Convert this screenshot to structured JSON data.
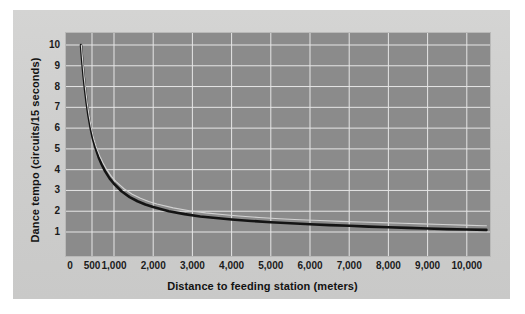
{
  "chart_data": {
    "type": "line",
    "title": "",
    "xlabel": "Distance to feeding station (meters)",
    "ylabel": "Dance tempo (circuits/15 seconds)",
    "xlim": [
      0,
      10500
    ],
    "ylim": [
      0,
      10.6
    ],
    "grid": true,
    "legend": "none",
    "background_color": "#8b8b8b",
    "gridline_color": "#e6e6e6",
    "xticks": [
      0,
      500,
      1000,
      2000,
      3000,
      4000,
      5000,
      6000,
      7000,
      8000,
      9000,
      10000
    ],
    "xticklabels": [
      "0",
      "500",
      "1,000",
      "2,000",
      "3,000",
      "4,000",
      "5,000",
      "6,000",
      "7,000",
      "8,000",
      "9,000",
      "10,000"
    ],
    "yticks": [
      1,
      2,
      3,
      4,
      5,
      6,
      7,
      8,
      9,
      10
    ],
    "yticklabels": [
      "1",
      "2",
      "3",
      "4",
      "5",
      "6",
      "7",
      "8",
      "9",
      "10"
    ],
    "series": [
      {
        "name": "dance-tempo-curve-dark",
        "color": "#141414",
        "width": 2.6,
        "points": [
          [
            250,
            10.0
          ],
          [
            280,
            9.2
          ],
          [
            310,
            8.5
          ],
          [
            340,
            7.9
          ],
          [
            380,
            7.2
          ],
          [
            420,
            6.6
          ],
          [
            470,
            6.0
          ],
          [
            520,
            5.5
          ],
          [
            580,
            5.05
          ],
          [
            650,
            4.6
          ],
          [
            720,
            4.25
          ],
          [
            800,
            3.92
          ],
          [
            900,
            3.58
          ],
          [
            1000,
            3.32
          ],
          [
            1200,
            2.95
          ],
          [
            1400,
            2.68
          ],
          [
            1600,
            2.48
          ],
          [
            1800,
            2.32
          ],
          [
            2000,
            2.2
          ],
          [
            2400,
            2.0
          ],
          [
            2800,
            1.86
          ],
          [
            3200,
            1.75
          ],
          [
            3600,
            1.67
          ],
          [
            4000,
            1.6
          ],
          [
            4500,
            1.53
          ],
          [
            5000,
            1.47
          ],
          [
            5500,
            1.42
          ],
          [
            6000,
            1.37
          ],
          [
            6500,
            1.33
          ],
          [
            7000,
            1.3
          ],
          [
            7500,
            1.26
          ],
          [
            8000,
            1.23
          ],
          [
            8500,
            1.2
          ],
          [
            9000,
            1.17
          ],
          [
            9500,
            1.14
          ],
          [
            10000,
            1.12
          ],
          [
            10500,
            1.1
          ]
        ]
      },
      {
        "name": "dance-tempo-curve-light",
        "color": "#d2d2d2",
        "width": 1.1,
        "points": [
          [
            258,
            10.0
          ],
          [
            290,
            9.2
          ],
          [
            320,
            8.5
          ],
          [
            352,
            7.9
          ],
          [
            392,
            7.2
          ],
          [
            434,
            6.6
          ],
          [
            486,
            6.0
          ],
          [
            540,
            5.5
          ],
          [
            604,
            5.05
          ],
          [
            678,
            4.65
          ],
          [
            752,
            4.32
          ],
          [
            836,
            4.0
          ],
          [
            940,
            3.68
          ],
          [
            1045,
            3.44
          ],
          [
            1255,
            3.08
          ],
          [
            1465,
            2.82
          ],
          [
            1675,
            2.62
          ],
          [
            1885,
            2.47
          ],
          [
            2095,
            2.35
          ],
          [
            2510,
            2.16
          ],
          [
            2925,
            2.02
          ],
          [
            3340,
            1.92
          ],
          [
            3760,
            1.84
          ],
          [
            4180,
            1.77
          ],
          [
            4700,
            1.7
          ],
          [
            5220,
            1.64
          ],
          [
            5740,
            1.59
          ],
          [
            6260,
            1.55
          ],
          [
            6790,
            1.51
          ],
          [
            7310,
            1.48
          ],
          [
            7830,
            1.45
          ],
          [
            8350,
            1.42
          ],
          [
            8870,
            1.39
          ],
          [
            9390,
            1.36
          ],
          [
            9910,
            1.33
          ],
          [
            10430,
            1.3
          ],
          [
            10500,
            1.3
          ]
        ]
      }
    ]
  },
  "axis": {
    "x_title": "Distance to feeding station (meters)",
    "y_title": "Dance tempo (circuits/15 seconds)"
  }
}
